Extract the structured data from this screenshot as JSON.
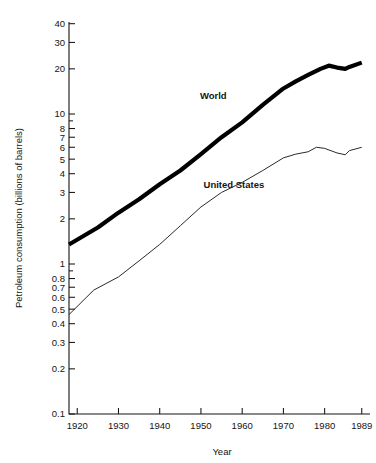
{
  "chart_data": {
    "type": "line",
    "title": "",
    "xlabel": "Year",
    "ylabel": "Petroleum consumption (billions of barrels)",
    "yscale": "log",
    "ylim": [
      0.1,
      50
    ],
    "xlim": [
      1918,
      1991
    ],
    "grid": false,
    "legend_position": "inline-annotation",
    "x_ticks": [
      1920,
      1930,
      1940,
      1950,
      1960,
      1970,
      1980,
      1989
    ],
    "x_tick_labels": [
      "1920",
      "1930",
      "1940",
      "1950",
      "1960",
      "1970",
      "1980",
      "1989"
    ],
    "y_ticks": [
      0.1,
      0.2,
      0.3,
      0.4,
      0.5,
      0.6,
      0.7,
      0.8,
      1,
      2,
      3,
      4,
      5,
      6,
      7,
      8,
      10,
      20,
      30,
      40
    ],
    "y_tick_labels": [
      "0.1",
      "0.2",
      "0.3",
      "0.4",
      "0.5",
      "0.6",
      "0.7",
      "0.8",
      "1",
      "2",
      "3",
      "4",
      "5",
      "6",
      "7",
      "8",
      "10",
      "20",
      "30",
      "40"
    ],
    "y_minor_ticks": [
      0.9,
      9,
      50
    ],
    "series": [
      {
        "name": "World",
        "label": "World",
        "style": "thick-black",
        "x": [
          1918,
          1925,
          1930,
          1935,
          1940,
          1945,
          1950,
          1955,
          1960,
          1965,
          1970,
          1973,
          1976,
          1979,
          1981,
          1983,
          1985,
          1986,
          1989
        ],
        "values": [
          1.35,
          1.75,
          2.2,
          2.7,
          3.4,
          4.2,
          5.4,
          7.0,
          8.8,
          11.5,
          14.8,
          16.5,
          18.2,
          20.0,
          21.0,
          20.4,
          20.0,
          20.6,
          22.0
        ]
      },
      {
        "name": "United States",
        "label": "United States",
        "style": "thin-line",
        "x": [
          1918,
          1924,
          1930,
          1935,
          1940,
          1945,
          1950,
          1955,
          1960,
          1965,
          1970,
          1973,
          1976,
          1978,
          1980,
          1983,
          1985,
          1986,
          1989
        ],
        "values": [
          0.46,
          0.67,
          0.82,
          1.05,
          1.35,
          1.8,
          2.4,
          3.0,
          3.5,
          4.2,
          5.1,
          5.4,
          5.6,
          6.0,
          5.9,
          5.5,
          5.35,
          5.7,
          6.0
        ]
      }
    ],
    "annotations": [
      {
        "text": "World",
        "x": 1953,
        "y": 12.5
      },
      {
        "text": "United States",
        "x": 1958,
        "y": 3.2
      }
    ]
  }
}
